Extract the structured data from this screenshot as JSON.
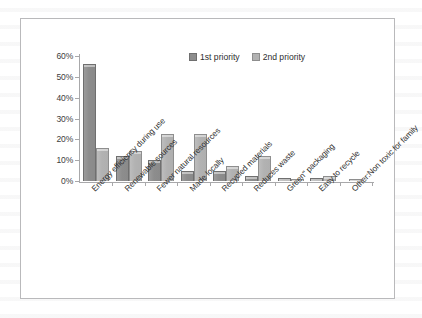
{
  "chart_data": {
    "type": "bar",
    "title": "",
    "xlabel": "",
    "ylabel": "",
    "ylim": [
      0,
      60
    ],
    "grid": false,
    "legend_position": "top-center",
    "ytick_labels": [
      "60%",
      "50%",
      "40%",
      "30%",
      "20%",
      "10%",
      "0%"
    ],
    "ytick_values": [
      60,
      50,
      40,
      30,
      20,
      10,
      0
    ],
    "categories": [
      "Energy efficiency during use",
      "Renewable sources",
      "Fewer natural resources",
      "Made locally",
      "Recycled materials",
      "Reduces waste",
      "Green\" packaging",
      "Easy to recycle",
      "Other:Non toxic for family"
    ],
    "series": [
      {
        "name": "1st priority",
        "color": "#8d8d8d",
        "values": [
          56,
          12,
          10,
          5,
          5,
          2.5,
          1.5,
          1.5,
          0
        ]
      },
      {
        "name": "2nd priority",
        "color": "#b2b2b2",
        "values": [
          16,
          14.5,
          22.5,
          22.5,
          7,
          12,
          0.8,
          2.5,
          0.8
        ]
      }
    ]
  },
  "legend": {
    "series1_label": "1st priority",
    "series2_label": "2nd priority"
  },
  "frame": {
    "border_color": "#b9b9bb",
    "background": "#ffffff"
  }
}
